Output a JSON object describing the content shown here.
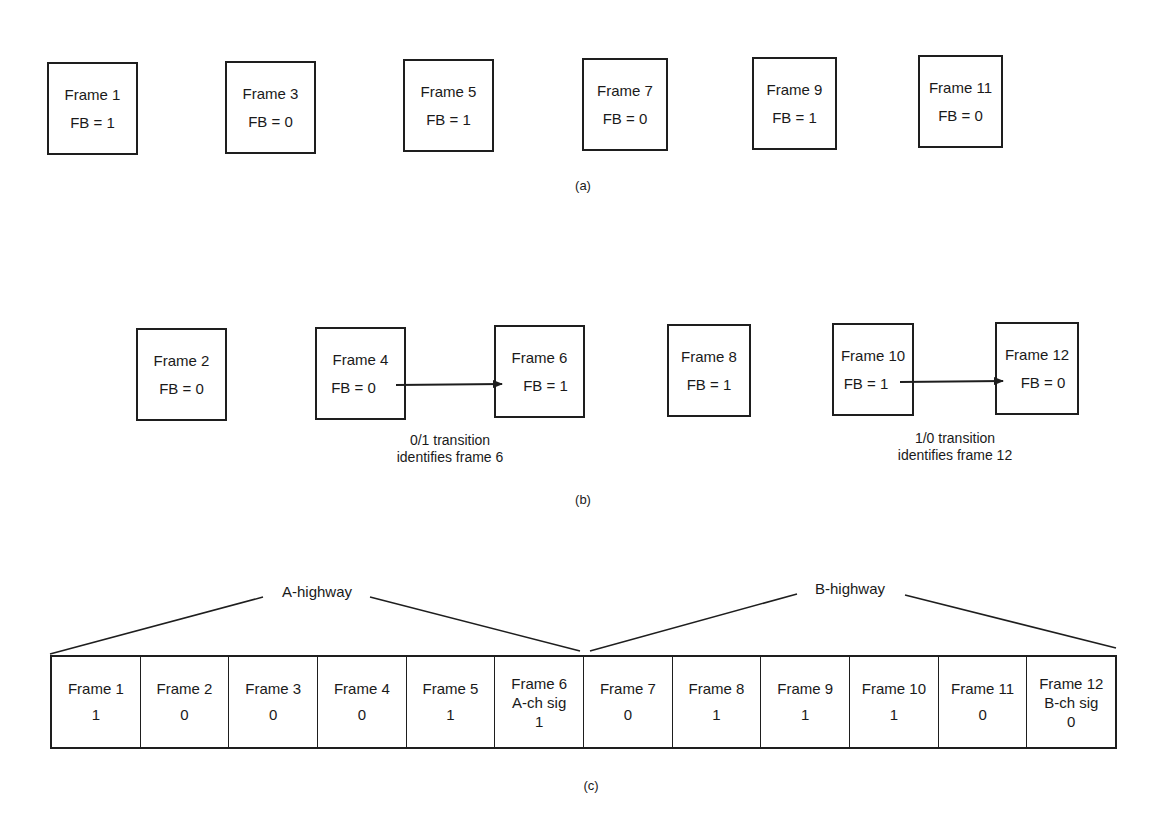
{
  "section_a": {
    "caption": "(a)",
    "frames": [
      {
        "name": "Frame 1",
        "fb": "FB = 1"
      },
      {
        "name": "Frame 3",
        "fb": "FB = 0"
      },
      {
        "name": "Frame 5",
        "fb": "FB = 1"
      },
      {
        "name": "Frame 7",
        "fb": "FB = 0"
      },
      {
        "name": "Frame 9",
        "fb": "FB = 1"
      },
      {
        "name": "Frame 11",
        "fb": "FB = 0"
      }
    ]
  },
  "section_b": {
    "caption": "(b)",
    "frames": [
      {
        "name": "Frame 2",
        "fb": "FB = 0"
      },
      {
        "name": "Frame 4",
        "fb": "FB = 0"
      },
      {
        "name": "Frame 6",
        "fb": "FB = 1"
      },
      {
        "name": "Frame 8",
        "fb": "FB = 1"
      },
      {
        "name": "Frame 10",
        "fb": "FB = 1"
      },
      {
        "name": "Frame 12",
        "fb": "FB = 0"
      }
    ],
    "transitions": [
      {
        "from": "Frame 4",
        "to": "Frame 6",
        "line1": "0/1 transition",
        "line2": "identifies frame 6"
      },
      {
        "from": "Frame 10",
        "to": "Frame 12",
        "line1": "1/0 transition",
        "line2": "identifies frame 12"
      }
    ]
  },
  "section_c": {
    "caption": "(c)",
    "highways": [
      {
        "label": "A-highway",
        "frames": "1-6"
      },
      {
        "label": "B-highway",
        "frames": "7-12"
      }
    ],
    "cells": [
      {
        "name": "Frame 1",
        "value": "1"
      },
      {
        "name": "Frame 2",
        "value": "0"
      },
      {
        "name": "Frame 3",
        "value": "0"
      },
      {
        "name": "Frame 4",
        "value": "0"
      },
      {
        "name": "Frame 5",
        "value": "1"
      },
      {
        "name": "Frame 6",
        "sig": "A-ch sig",
        "value": "1"
      },
      {
        "name": "Frame 7",
        "value": "0"
      },
      {
        "name": "Frame 8",
        "value": "1"
      },
      {
        "name": "Frame 9",
        "value": "1"
      },
      {
        "name": "Frame 10",
        "value": "1"
      },
      {
        "name": "Frame 11",
        "value": "0"
      },
      {
        "name": "Frame 12",
        "sig": "B-ch sig",
        "value": "0"
      }
    ]
  }
}
